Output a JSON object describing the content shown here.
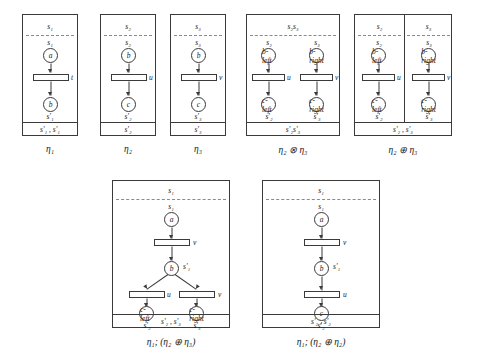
{
  "figure": {
    "row1": [
      {
        "id": "eta1",
        "caption": "η₁",
        "top_interface": "s₁",
        "bottom_interface": "s'₁ , s'₁",
        "places": [
          {
            "name": "a",
            "label_above": "s₁"
          },
          {
            "name": "b",
            "label_below": "s'₁"
          }
        ],
        "transitions": [
          {
            "name": "t",
            "label": "t"
          }
        ],
        "divider": "none"
      },
      {
        "id": "eta2",
        "caption": "η₂",
        "top_interface": "s₂",
        "bottom_interface": "s'₂",
        "places": [
          {
            "name": "b",
            "label_above": "s₂"
          },
          {
            "name": "c",
            "label_below": "s'₂"
          }
        ],
        "transitions": [
          {
            "name": "u",
            "label": "u"
          }
        ],
        "divider": "none"
      },
      {
        "id": "eta3",
        "caption": "η₃",
        "top_interface": "s₃",
        "bottom_interface": "s'₃",
        "places": [
          {
            "name": "b",
            "label_above": "s₃"
          },
          {
            "name": "c",
            "label_below": "s'₃"
          }
        ],
        "transitions": [
          {
            "name": "v",
            "label": "v"
          }
        ],
        "divider": "none"
      },
      {
        "id": "eta2-tensor-eta3",
        "caption": "η₂ ⊗ η₃",
        "top_interface": "s₂s₃",
        "bottom_interface": "s'₂s'₃",
        "places": [
          {
            "name": "b-left",
            "label_above": "s₂"
          },
          {
            "name": "b-right",
            "label_above": "s₃"
          },
          {
            "name": "c-left",
            "label_below": "s'₂"
          },
          {
            "name": "c-right",
            "label_below": "s'₃"
          }
        ],
        "transitions": [
          {
            "name": "u",
            "label": "u"
          },
          {
            "name": "v",
            "label": "v"
          }
        ],
        "divider": "none"
      },
      {
        "id": "eta2-sum-eta3",
        "caption": "η₂ ⊕ η₃",
        "top_interface_left": "s₂",
        "top_interface_right": "s₃",
        "bottom_interface": "s'₂ , s'₃",
        "places": [
          {
            "name": "b-left",
            "label_above": "s₂"
          },
          {
            "name": "b-right",
            "label_above": "s₃"
          },
          {
            "name": "c-left",
            "label_below": "s'₂"
          },
          {
            "name": "c-right",
            "label_below": "s'₃"
          }
        ],
        "transitions": [
          {
            "name": "u",
            "label": "u"
          },
          {
            "name": "v",
            "label": "v"
          }
        ],
        "divider": "vertical"
      }
    ],
    "row2": [
      {
        "id": "eta1-seq-eta2-sum-eta3",
        "caption": "η₁; (η₂ ⊕ η₃)",
        "top_interface": "s₁",
        "bottom_interface": "s'₂ , s'₃",
        "places": [
          {
            "name": "a",
            "label_above": "s₁"
          },
          {
            "name": "b",
            "label_right": "s'₁"
          },
          {
            "name": "c-left",
            "label_below": "s'₂"
          },
          {
            "name": "c-right",
            "label_below": "s'₃"
          }
        ],
        "transitions": [
          {
            "name": "v-top",
            "label": "v"
          },
          {
            "name": "u-bottom",
            "label": "u"
          },
          {
            "name": "v-bottom",
            "label": "v"
          }
        ],
        "divider": "none"
      },
      {
        "id": "eta1-seq-eta2-sum-eta2",
        "caption": "η₁; (η₂ ⊕ η₂)",
        "top_interface": "s₁",
        "bottom_interface": "s'₂ , s'₂",
        "places": [
          {
            "name": "a",
            "label_above": "s₁"
          },
          {
            "name": "b",
            "label_right": "s'₁"
          },
          {
            "name": "c",
            "label_below": "s'₂"
          }
        ],
        "transitions": [
          {
            "name": "v",
            "label": "v"
          },
          {
            "name": "u",
            "label": "u"
          }
        ],
        "divider": "none"
      }
    ]
  }
}
